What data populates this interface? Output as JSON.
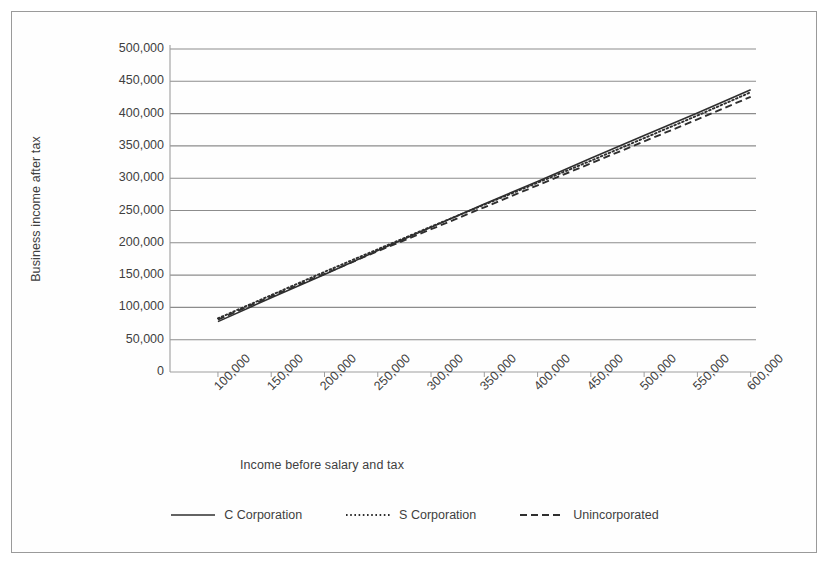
{
  "chart_data": {
    "type": "line",
    "title": "",
    "xlabel": "Income before salary and tax",
    "ylabel": "Business income after tax",
    "grid": true,
    "legend_position": "bottom",
    "xlim": [
      75000,
      625000
    ],
    "ylim": [
      0,
      500000
    ],
    "x_tick_labels": [
      "100,000",
      "150,000",
      "200,000",
      "250,000",
      "300,000",
      "350,000",
      "400,000",
      "450,000",
      "500,000",
      "550,000",
      "600,000"
    ],
    "y_tick_labels": [
      "0",
      "50,000",
      "100,000",
      "150,000",
      "200,000",
      "250,000",
      "300,000",
      "350,000",
      "400,000",
      "450,000",
      "500,000"
    ],
    "x": [
      120000,
      170000,
      220000,
      270000,
      320000,
      370000,
      420000,
      470000,
      520000,
      570000,
      620000
    ],
    "series": [
      {
        "name": "C Corporation",
        "style": "solid",
        "color": "#2f2f2f",
        "values": [
          78000,
          115000,
          151000,
          188000,
          224000,
          260000,
          295000,
          331000,
          366000,
          401000,
          437000
        ]
      },
      {
        "name": "S Corporation",
        "style": "dotted",
        "color": "#2f2f2f",
        "values": [
          83000,
          119000,
          155000,
          190000,
          225000,
          259000,
          293000,
          327000,
          362000,
          397000,
          433000
        ]
      },
      {
        "name": "Unincorporated",
        "style": "dashed",
        "color": "#2f2f2f",
        "values": [
          81000,
          117000,
          152000,
          187000,
          221000,
          255000,
          289000,
          323000,
          357000,
          391000,
          426000
        ]
      }
    ]
  },
  "legend": {
    "items": [
      {
        "label": "C Corporation",
        "style": "solid"
      },
      {
        "label": "S Corporation",
        "style": "dotted"
      },
      {
        "label": "Unincorporated",
        "style": "dashed"
      }
    ]
  }
}
